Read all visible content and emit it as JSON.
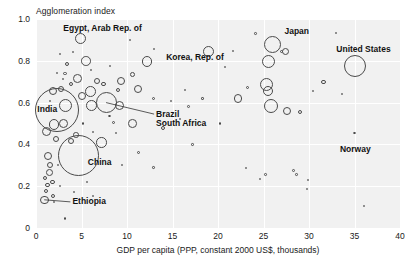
{
  "chart_data": {
    "type": "scatter",
    "title": "",
    "ylabel": "Agglomeration index",
    "xlabel": "GDP per capita (PPP, constant 2000 US$, thousands)",
    "xlim": [
      0,
      40
    ],
    "ylim": [
      0,
      1.0
    ],
    "xticks": [
      "0",
      "5",
      "10",
      "15",
      "20",
      "25",
      "30",
      "35",
      "40"
    ],
    "xtick_values": [
      0,
      5,
      10,
      15,
      20,
      25,
      30,
      35,
      40
    ],
    "yticks": [
      "0",
      "0.2",
      "0.4",
      "0.6",
      "0.8",
      "1.0"
    ],
    "ytick_values": [
      0,
      0.2,
      0.4,
      0.6,
      0.8,
      1.0
    ],
    "grid": true,
    "legend": "none",
    "size_encoding": "population",
    "plot_bg": "#f1f1f1",
    "grid_color": "#ffffff",
    "marker_color": "#4a4a4a",
    "annotations": [
      {
        "label": "Egypt, Arab Rep. of",
        "x": 4.9,
        "y": 0.905,
        "label_x": 3.0,
        "label_y": 0.955,
        "leader": false
      },
      {
        "label": "Korea, Rep. of",
        "x": 19.0,
        "y": 0.845,
        "label_x": 14.3,
        "label_y": 0.815,
        "leader": false
      },
      {
        "label": "Japan",
        "x": 26.0,
        "y": 0.88,
        "label_x": 27.3,
        "label_y": 0.94,
        "leader": false
      },
      {
        "label": "United States",
        "x": 35.0,
        "y": 0.775,
        "label_x": 33.0,
        "label_y": 0.855,
        "leader": false
      },
      {
        "label": "India",
        "x": 2.3,
        "y": 0.565,
        "label_x": 0.15,
        "label_y": 0.565,
        "leader": false
      },
      {
        "label": "Brazil",
        "x": 7.7,
        "y": 0.6,
        "label_x": 13.2,
        "label_y": 0.545,
        "leader": true
      },
      {
        "label": "South Africa",
        "x": 10.6,
        "y": 0.5,
        "label_x": 13.2,
        "label_y": 0.498,
        "leader": false
      },
      {
        "label": "China",
        "x": 4.7,
        "y": 0.345,
        "label_x": 5.7,
        "label_y": 0.315,
        "leader": false
      },
      {
        "label": "Norway",
        "x": 35.0,
        "y": 0.455,
        "label_x": 33.4,
        "label_y": 0.375,
        "leader": false
      },
      {
        "label": "Ethiopia",
        "x": 0.9,
        "y": 0.135,
        "label_x": 4.0,
        "label_y": 0.125,
        "leader": true
      }
    ],
    "points": [
      {
        "x": 4.9,
        "y": 0.905,
        "r": 5.6
      },
      {
        "x": 2.35,
        "y": 0.565,
        "r": 22.0
      },
      {
        "x": 4.7,
        "y": 0.345,
        "r": 20.5
      },
      {
        "x": 35.0,
        "y": 0.775,
        "r": 11.0
      },
      {
        "x": 26.0,
        "y": 0.88,
        "r": 8.5
      },
      {
        "x": 25.6,
        "y": 0.795,
        "r": 6.5
      },
      {
        "x": 25.3,
        "y": 0.685,
        "r": 6.5
      },
      {
        "x": 25.5,
        "y": 0.655,
        "r": 5.2
      },
      {
        "x": 25.8,
        "y": 0.585,
        "r": 7.0
      },
      {
        "x": 27.6,
        "y": 0.56,
        "r": 4.2
      },
      {
        "x": 27.4,
        "y": 0.845,
        "r": 3.6
      },
      {
        "x": 27.0,
        "y": 0.845,
        "r": 1.8
      },
      {
        "x": 29.0,
        "y": 0.555,
        "r": 2.0
      },
      {
        "x": 22.2,
        "y": 0.62,
        "r": 4.2
      },
      {
        "x": 19.0,
        "y": 0.845,
        "r": 5.5
      },
      {
        "x": 31.6,
        "y": 0.7,
        "r": 2.1
      },
      {
        "x": 24.1,
        "y": 0.93,
        "r": 1.3
      },
      {
        "x": 23.2,
        "y": 0.67,
        "r": 1.5
      },
      {
        "x": 12.2,
        "y": 0.795,
        "r": 5.4
      },
      {
        "x": 10.6,
        "y": 0.735,
        "r": 2.4
      },
      {
        "x": 9.3,
        "y": 0.705,
        "r": 4.1
      },
      {
        "x": 11.2,
        "y": 0.665,
        "r": 4.3
      },
      {
        "x": 9.0,
        "y": 0.66,
        "r": 2.0
      },
      {
        "x": 7.7,
        "y": 0.6,
        "r": 10.5
      },
      {
        "x": 9.2,
        "y": 0.585,
        "r": 4.6
      },
      {
        "x": 6.0,
        "y": 0.655,
        "r": 5.4
      },
      {
        "x": 6.1,
        "y": 0.585,
        "r": 5.4
      },
      {
        "x": 5.0,
        "y": 0.63,
        "r": 4.0
      },
      {
        "x": 6.7,
        "y": 0.705,
        "r": 3.1
      },
      {
        "x": 7.4,
        "y": 0.69,
        "r": 2.2
      },
      {
        "x": 3.4,
        "y": 0.785,
        "r": 2.4
      },
      {
        "x": 3.2,
        "y": 0.74,
        "r": 1.7
      },
      {
        "x": 5.5,
        "y": 0.8,
        "r": 4.8
      },
      {
        "x": 4.6,
        "y": 0.715,
        "r": 4.4
      },
      {
        "x": 3.2,
        "y": 0.585,
        "r": 6.5
      },
      {
        "x": 1.9,
        "y": 0.655,
        "r": 4.2
      },
      {
        "x": 2.0,
        "y": 0.495,
        "r": 5.2
      },
      {
        "x": 3.0,
        "y": 0.5,
        "r": 4.4
      },
      {
        "x": 1.1,
        "y": 0.46,
        "r": 4.5
      },
      {
        "x": 2.2,
        "y": 0.425,
        "r": 3.2
      },
      {
        "x": 1.3,
        "y": 0.345,
        "r": 4.0
      },
      {
        "x": 1.5,
        "y": 0.3,
        "r": 3.0
      },
      {
        "x": 1.5,
        "y": 0.265,
        "r": 3.4
      },
      {
        "x": 1.0,
        "y": 0.24,
        "r": 2.1
      },
      {
        "x": 1.8,
        "y": 0.22,
        "r": 2.2
      },
      {
        "x": 1.25,
        "y": 0.205,
        "r": 2.3
      },
      {
        "x": 1.05,
        "y": 0.175,
        "r": 2.0
      },
      {
        "x": 0.95,
        "y": 0.135,
        "r": 4.2
      },
      {
        "x": 1.9,
        "y": 0.155,
        "r": 2.0
      },
      {
        "x": 3.9,
        "y": 0.415,
        "r": 3.0
      },
      {
        "x": 4.4,
        "y": 0.445,
        "r": 2.7
      },
      {
        "x": 7.2,
        "y": 0.41,
        "r": 5.2
      },
      {
        "x": 10.6,
        "y": 0.5,
        "r": 4.3
      },
      {
        "x": 2.8,
        "y": 0.665,
        "r": 3.0
      },
      {
        "x": 3.9,
        "y": 0.69,
        "r": 2.0
      },
      {
        "x": 2.3,
        "y": 0.74,
        "r": 1.1
      },
      {
        "x": 3.0,
        "y": 0.715,
        "r": 1.0
      },
      {
        "x": 8.5,
        "y": 0.505,
        "r": 1.5
      },
      {
        "x": 8.1,
        "y": 0.535,
        "r": 1.3
      },
      {
        "x": 8.8,
        "y": 0.455,
        "r": 1.1
      },
      {
        "x": 12.9,
        "y": 0.62,
        "r": 1.5
      },
      {
        "x": 14.8,
        "y": 0.61,
        "r": 1.0
      },
      {
        "x": 16.4,
        "y": 0.66,
        "r": 1.2
      },
      {
        "x": 16.8,
        "y": 0.58,
        "r": 1.4
      },
      {
        "x": 18.3,
        "y": 0.62,
        "r": 1.1
      },
      {
        "x": 14.0,
        "y": 0.48,
        "r": 2.1
      },
      {
        "x": 15.8,
        "y": 0.52,
        "r": 1.0
      },
      {
        "x": 20.2,
        "y": 0.5,
        "r": 1.1
      },
      {
        "x": 17.2,
        "y": 0.4,
        "r": 1.2
      },
      {
        "x": 11.3,
        "y": 0.36,
        "r": 1.6
      },
      {
        "x": 12.9,
        "y": 0.29,
        "r": 1.2
      },
      {
        "x": 9.5,
        "y": 0.3,
        "r": 1.0
      },
      {
        "x": 5.6,
        "y": 0.22,
        "r": 1.0
      },
      {
        "x": 6.3,
        "y": 0.155,
        "r": 1.0
      },
      {
        "x": 3.2,
        "y": 0.045,
        "r": 1.2
      },
      {
        "x": 20.8,
        "y": 0.77,
        "r": 1.1
      },
      {
        "x": 21.6,
        "y": 0.845,
        "r": 0.9
      },
      {
        "x": 13.0,
        "y": 0.855,
        "r": 0.9
      },
      {
        "x": 10.3,
        "y": 0.9,
        "r": 0.9
      },
      {
        "x": 8.1,
        "y": 0.775,
        "r": 0.9
      },
      {
        "x": 6.0,
        "y": 0.755,
        "r": 0.9
      },
      {
        "x": 33.0,
        "y": 0.935,
        "r": 0.9
      },
      {
        "x": 30.4,
        "y": 0.655,
        "r": 1.0
      },
      {
        "x": 35.0,
        "y": 0.455,
        "r": 1.2
      },
      {
        "x": 28.6,
        "y": 0.255,
        "r": 1.3
      },
      {
        "x": 28.3,
        "y": 0.275,
        "r": 1.4
      },
      {
        "x": 29.8,
        "y": 0.185,
        "r": 1.0
      },
      {
        "x": 29.9,
        "y": 0.23,
        "r": 0.8
      },
      {
        "x": 36.0,
        "y": 0.105,
        "r": 0.9
      },
      {
        "x": 24.6,
        "y": 0.235,
        "r": 1.0
      },
      {
        "x": 25.2,
        "y": 0.255,
        "r": 1.3
      },
      {
        "x": 23.0,
        "y": 0.29,
        "r": 0.8
      },
      {
        "x": 33.6,
        "y": 0.64,
        "r": 0.9
      },
      {
        "x": 2.6,
        "y": 0.835,
        "r": 0.9
      },
      {
        "x": 4.0,
        "y": 0.845,
        "r": 0.8
      },
      {
        "x": 1.5,
        "y": 0.61,
        "r": 0.9
      },
      {
        "x": 2.0,
        "y": 0.125,
        "r": 1.0
      },
      {
        "x": 2.4,
        "y": 0.3,
        "r": 1.1
      },
      {
        "x": 2.6,
        "y": 0.2,
        "r": 1.0
      },
      {
        "x": 5.2,
        "y": 0.5,
        "r": 1.1
      },
      {
        "x": 6.3,
        "y": 0.46,
        "r": 1.0
      },
      {
        "x": 4.2,
        "y": 0.175,
        "r": 0.9
      }
    ]
  },
  "footer": {
    "source": ""
  }
}
